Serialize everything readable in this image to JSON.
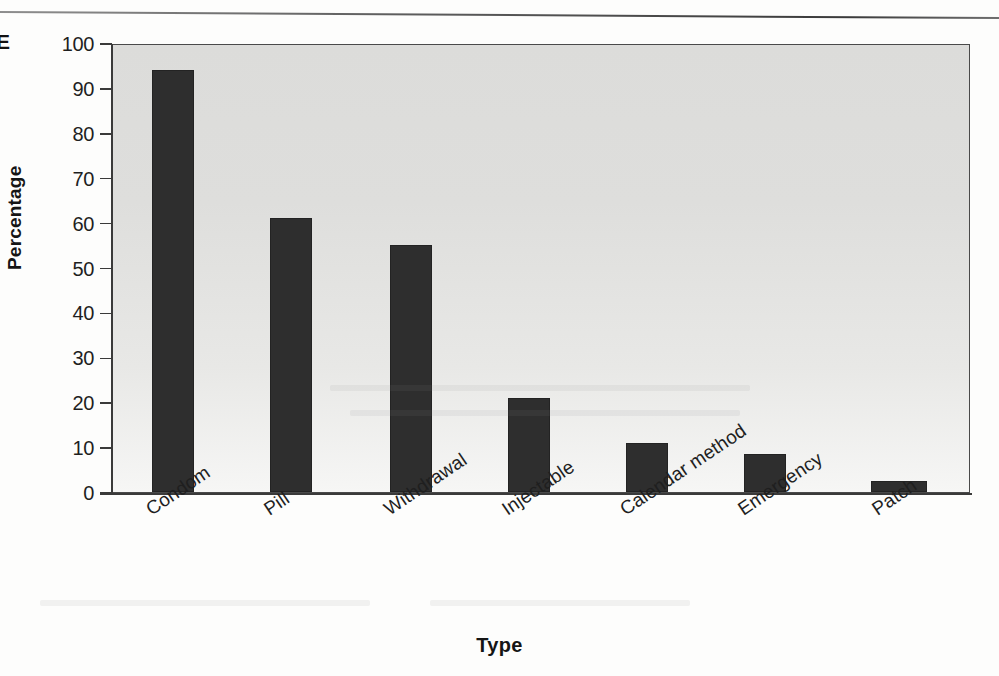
{
  "figure": {
    "panel_letter": "E",
    "separator_rule": "top-horizontal-rule"
  },
  "chart_data": {
    "type": "bar",
    "title": "",
    "subtitle": "",
    "xlabel": "Type",
    "ylabel": "Percentage",
    "categories": [
      "Condom",
      "Pill",
      "Withdrawal",
      "Injectable",
      "Calendar method",
      "Emergency",
      "Patch"
    ],
    "values": [
      94,
      61,
      55,
      21,
      11,
      8.5,
      2.5
    ],
    "ylim": [
      0,
      100
    ],
    "ytick_labels": [
      "0",
      "10",
      "20",
      "30",
      "40",
      "50",
      "60",
      "70",
      "80",
      "90",
      "100"
    ],
    "ytick_values": [
      0,
      10,
      20,
      30,
      40,
      50,
      60,
      70,
      80,
      90,
      100
    ],
    "grid": false,
    "legend": "none",
    "bar_color": "#2e2e2e",
    "plot_background_color": "#e2e2e0",
    "axis_color": "#3a3a3a"
  }
}
